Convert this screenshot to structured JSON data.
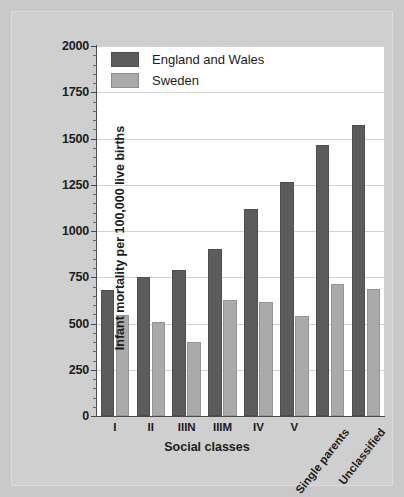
{
  "chart_data": {
    "type": "bar",
    "title": "",
    "xlabel": "Social classes",
    "ylabel": "Infant mortality per 100,000 live births",
    "categories": [
      "I",
      "II",
      "IIIN",
      "IIIM",
      "IV",
      "V",
      "Single parents",
      "Unclassified"
    ],
    "series": [
      {
        "name": "England and Wales",
        "color": "#5c5c5c",
        "values": [
          680,
          750,
          790,
          905,
          1120,
          1265,
          1465,
          1575
        ]
      },
      {
        "name": "Sweden",
        "color": "#aaaaaa",
        "values": [
          545,
          510,
          400,
          628,
          615,
          540,
          715,
          685
        ]
      }
    ],
    "ylim": [
      0,
      2000
    ],
    "ytick_labels": [
      "0",
      "250",
      "500",
      "750",
      "1000",
      "1250",
      "1500",
      "1750",
      "2000"
    ],
    "ytick_values": [
      0,
      250,
      500,
      750,
      1000,
      1250,
      1500,
      1750,
      2000
    ],
    "ytick_minor_step": 50,
    "grid": true,
    "grid_axis": "y",
    "legend_position": "top-left",
    "rotated_categories": [
      "Single parents",
      "Unclassified"
    ]
  },
  "legend": {
    "entries": [
      {
        "label": "England and Wales",
        "swatch": "dark-gray-swatch"
      },
      {
        "label": "Sweden",
        "swatch": "light-gray-swatch"
      }
    ]
  },
  "colors": {
    "background": "#c9c9c9",
    "frame": "#cfcfcf",
    "plot_background": "#ffffff",
    "gridline": "#d2d2d2",
    "axis": "#4a4a4a",
    "series_england_wales": "#5c5c5c",
    "series_sweden": "#aaaaaa",
    "text": "#1c1c1c"
  }
}
